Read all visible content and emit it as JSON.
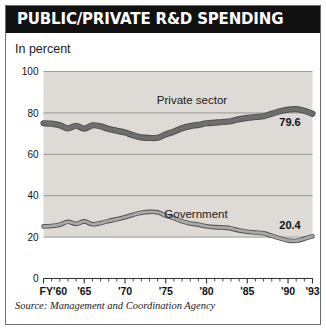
{
  "figure": {
    "title": "PUBLIC/PRIVATE R&D SPENDING",
    "subtitle": "In percent",
    "source": "Source: Management and Coordination Agency",
    "title_bar_color": "#111111",
    "title_text_color": "#ffffff",
    "plot_background": "#dedbd6",
    "frame_color": "#6b6b6b"
  },
  "chart_data": {
    "type": "line",
    "title": "PUBLIC/PRIVATE R&D SPENDING",
    "subtitle": "In percent",
    "xlabel": "",
    "ylabel": "In percent",
    "ylim": [
      0,
      100
    ],
    "yticks": [
      0,
      20,
      40,
      60,
      80,
      100
    ],
    "ytick_labels": [
      "0",
      "20",
      "40",
      "60",
      "80",
      "100"
    ],
    "xlim": [
      1960,
      1993
    ],
    "xticks": [
      1960,
      1965,
      1970,
      1975,
      1980,
      1985,
      1990,
      1993
    ],
    "xtick_labels": [
      "FY'60",
      "'65",
      "'70",
      "'75",
      "'80",
      "'85",
      "'90",
      "'93"
    ],
    "minor_xticks_every": 1,
    "grid": "horizontal",
    "legend": "inline-annotation",
    "x": [
      1960,
      1961,
      1962,
      1963,
      1964,
      1965,
      1966,
      1967,
      1968,
      1969,
      1970,
      1971,
      1972,
      1973,
      1974,
      1975,
      1976,
      1977,
      1978,
      1979,
      1980,
      1981,
      1982,
      1983,
      1984,
      1985,
      1986,
      1987,
      1988,
      1989,
      1990,
      1991,
      1992,
      1993
    ],
    "series": [
      {
        "name": "Private sector",
        "label": "Private sector",
        "color": "#6e6e6e",
        "end_value_label": "79.6",
        "values": [
          75.0,
          74.8,
          74.0,
          72.5,
          73.8,
          72.4,
          74.0,
          73.5,
          72.2,
          71.4,
          70.5,
          69.2,
          68.2,
          67.9,
          68.0,
          69.6,
          71.0,
          72.6,
          73.6,
          74.2,
          75.0,
          75.3,
          75.6,
          76.0,
          77.0,
          77.6,
          78.0,
          78.4,
          79.6,
          80.8,
          81.6,
          81.8,
          81.0,
          79.6
        ]
      },
      {
        "name": "Government",
        "label": "Government",
        "color": "#a9a9a9",
        "end_value_label": "20.4",
        "values": [
          25.2,
          25.4,
          26.0,
          27.4,
          26.4,
          27.6,
          26.2,
          26.8,
          27.8,
          28.6,
          29.6,
          30.8,
          31.8,
          32.2,
          32.0,
          30.4,
          29.2,
          27.6,
          26.6,
          26.0,
          25.2,
          24.8,
          24.6,
          24.2,
          23.2,
          22.6,
          22.2,
          21.8,
          20.6,
          19.4,
          18.4,
          18.2,
          19.2,
          20.4
        ]
      }
    ]
  }
}
